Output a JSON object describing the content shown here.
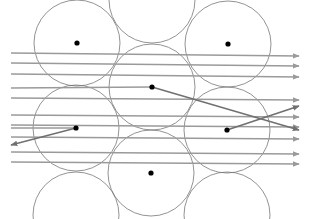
{
  "diagram": {
    "colors": {
      "background": "#ffffff",
      "circle_stroke": "#777777",
      "ray_stroke": "#9a9a9a",
      "deflected_ray_stroke": "#707070",
      "dot_fill": "#000000"
    },
    "circle_radius": 43,
    "circles": [
      {
        "cx": 77,
        "cy": 43
      },
      {
        "cx": 152,
        "cy": 0
      },
      {
        "cx": 228,
        "cy": 44
      },
      {
        "cx": 152,
        "cy": 87
      },
      {
        "cx": 76,
        "cy": 128
      },
      {
        "cx": 227,
        "cy": 130
      },
      {
        "cx": 151,
        "cy": 173
      },
      {
        "cx": 76,
        "cy": 215
      },
      {
        "cx": 227,
        "cy": 215
      }
    ],
    "dots": [
      {
        "cx": 77,
        "cy": 43
      },
      {
        "cx": 228,
        "cy": 44
      },
      {
        "cx": 152,
        "cy": 87
      },
      {
        "cx": 76,
        "cy": 128
      },
      {
        "cx": 227,
        "cy": 130
      },
      {
        "cx": 151,
        "cy": 173
      }
    ],
    "horizontal_rays": [
      {
        "x1": 11,
        "y1": 53,
        "x2": 299,
        "y2": 56
      },
      {
        "x1": 11,
        "y1": 63,
        "x2": 299,
        "y2": 66
      },
      {
        "x1": 11,
        "y1": 74,
        "x2": 299,
        "y2": 77
      },
      {
        "x1": 11,
        "y1": 98,
        "x2": 299,
        "y2": 100
      },
      {
        "x1": 11,
        "y1": 115,
        "x2": 299,
        "y2": 117
      },
      {
        "x1": 11,
        "y1": 125,
        "x2": 299,
        "y2": 127
      },
      {
        "x1": 11,
        "y1": 137,
        "x2": 299,
        "y2": 139
      },
      {
        "x1": 11,
        "y1": 152,
        "x2": 299,
        "y2": 154
      },
      {
        "x1": 11,
        "y1": 162,
        "x2": 299,
        "y2": 164
      }
    ],
    "terminating_rays": [
      {
        "x1": 11,
        "y1": 88,
        "x2": 152,
        "y2": 87
      },
      {
        "x1": 11,
        "y1": 128,
        "x2": 76,
        "y2": 128
      }
    ],
    "deflected_rays": [
      {
        "x1": 152,
        "y1": 87,
        "x2": 299,
        "y2": 130
      },
      {
        "x1": 76,
        "y1": 128,
        "x2": 11,
        "y2": 145
      },
      {
        "x1": 227,
        "y1": 130,
        "x2": 299,
        "y2": 106
      }
    ]
  }
}
